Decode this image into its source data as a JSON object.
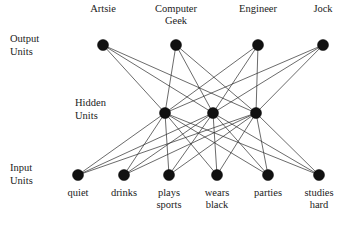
{
  "diagram": {
    "colors": {
      "node": "#111111",
      "edge": "#2b2b2b",
      "text": "#222222",
      "background": "#ffffff"
    },
    "node_radius": 5.5,
    "row_labels": [
      {
        "id": "output-units",
        "line1": "Output",
        "line2": "Units",
        "x": 10,
        "y": 42
      },
      {
        "id": "hidden-units",
        "line1": "Hidden",
        "line2": "Units",
        "x": 75,
        "y": 106
      },
      {
        "id": "input-units",
        "line1": "Input",
        "line2": "Units",
        "x": 10,
        "y": 171
      }
    ],
    "layers": {
      "output": {
        "name": "output",
        "y": 45,
        "label_position": "above",
        "nodes": [
          {
            "id": "artsie",
            "x": 103,
            "label_line1": "Artsie",
            "label_line2": ""
          },
          {
            "id": "computer-geek",
            "x": 176,
            "label_line1": "Computer",
            "label_line2": "Geek"
          },
          {
            "id": "engineer",
            "x": 258,
            "label_line1": "Engineer",
            "label_line2": ""
          },
          {
            "id": "jock",
            "x": 323,
            "label_line1": "Jock",
            "label_line2": ""
          }
        ]
      },
      "hidden": {
        "name": "hidden",
        "y": 113,
        "label_position": "none",
        "nodes": [
          {
            "id": "hidden-1",
            "x": 165,
            "label_line1": "",
            "label_line2": ""
          },
          {
            "id": "hidden-2",
            "x": 213,
            "label_line1": "",
            "label_line2": ""
          },
          {
            "id": "hidden-3",
            "x": 256,
            "label_line1": "",
            "label_line2": ""
          }
        ]
      },
      "input": {
        "name": "input",
        "y": 175,
        "label_position": "below",
        "nodes": [
          {
            "id": "quiet",
            "x": 78,
            "label_line1": "quiet",
            "label_line2": ""
          },
          {
            "id": "drinks",
            "x": 124,
            "label_line1": "drinks",
            "label_line2": ""
          },
          {
            "id": "plays-sports",
            "x": 169,
            "label_line1": "plays",
            "label_line2": "sports"
          },
          {
            "id": "wears-black",
            "x": 217,
            "label_line1": "wears",
            "label_line2": "black"
          },
          {
            "id": "parties",
            "x": 268,
            "label_line1": "parties",
            "label_line2": ""
          },
          {
            "id": "studies-hard",
            "x": 319,
            "label_line1": "studies",
            "label_line2": "hard"
          }
        ]
      }
    },
    "connections": {
      "input_to_hidden": "full",
      "hidden_to_output": "full"
    },
    "label_offsets": {
      "above_line1_dy": -33,
      "above_line2_dy": -21,
      "below_line1_dy": 21,
      "below_line2_dy": 33,
      "row_label_line2_dy": 13
    }
  }
}
